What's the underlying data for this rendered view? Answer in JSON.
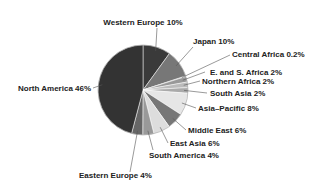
{
  "chart_data": {
    "type": "pie",
    "title": "",
    "start_angle_deg": 0,
    "direction": "clockwise",
    "slices": [
      {
        "label": "Western Europe",
        "value": 10,
        "display": "Western Europe 10%",
        "color": "#3a3a3a",
        "lx": 143,
        "ly": 25,
        "anchor": "middle",
        "px": 157,
        "py": 28
      },
      {
        "label": "Japan",
        "value": 10,
        "display": "Japan 10%",
        "color": "#777777",
        "lx": 193,
        "ly": 44,
        "anchor": "start",
        "px": 193,
        "py": 47
      },
      {
        "label": "Central Africa",
        "value": 0.2,
        "display": "Central Africa 0.2%",
        "color": "#555555",
        "lx": 232,
        "ly": 57,
        "anchor": "start",
        "px": 230,
        "py": 55
      },
      {
        "label": "E. and S. Africa",
        "value": 2,
        "display": "E. and S. Africa 2%",
        "color": "#999999",
        "lx": 210,
        "ly": 75,
        "anchor": "start",
        "px": 205,
        "py": 72
      },
      {
        "label": "Northern Africa",
        "value": 2,
        "display": "Northern Africa 2%",
        "color": "#bbbbbb",
        "lx": 202,
        "ly": 84,
        "anchor": "start",
        "px": 200,
        "py": 81
      },
      {
        "label": "South Asia",
        "value": 2,
        "display": "South Asia 2%",
        "color": "#aaaaaa",
        "lx": 210,
        "ly": 96,
        "anchor": "start",
        "px": 207,
        "py": 93
      },
      {
        "label": "Asia–Pacific",
        "value": 8,
        "display": "Asia–Pacific 8%",
        "color": "#e6e6e6",
        "lx": 198,
        "ly": 111,
        "anchor": "start",
        "px": 196,
        "py": 108
      },
      {
        "label": "Middle East",
        "value": 6,
        "display": "Middle East 6%",
        "color": "#777777",
        "lx": 188,
        "ly": 133,
        "anchor": "start",
        "px": 186,
        "py": 130
      },
      {
        "label": "East Asia",
        "value": 6,
        "display": "East Asia 6%",
        "color": "#dddddd",
        "lx": 170,
        "ly": 146,
        "anchor": "start",
        "px": 168,
        "py": 143
      },
      {
        "label": "South America",
        "value": 4,
        "display": "South America 4%",
        "color": "#999999",
        "lx": 149,
        "ly": 158,
        "anchor": "start",
        "px": 153,
        "py": 150
      },
      {
        "label": "Eastern Europe",
        "value": 4,
        "display": "Eastern Europe 4%",
        "color": "#666666",
        "lx": 79,
        "ly": 178,
        "anchor": "start",
        "px": 130,
        "py": 172
      },
      {
        "label": "North America",
        "value": 46,
        "display": "North America 46%",
        "color": "#333333",
        "lx": 18,
        "ly": 91,
        "anchor": "start",
        "px": 93,
        "py": 88
      }
    ],
    "center": [
      143,
      90
    ],
    "radius": 45,
    "legend": "none"
  }
}
